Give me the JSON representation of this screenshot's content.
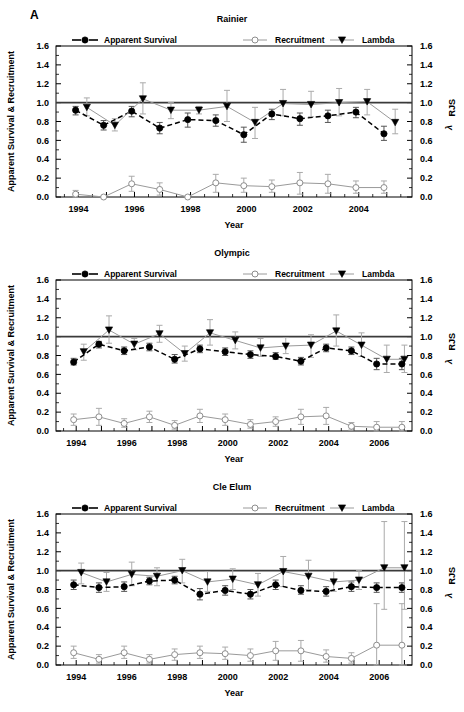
{
  "figure": {
    "panel_label": "A",
    "xlabel": "Year",
    "ylabel_left": "Apparent Survival & Recruitment",
    "ylabel_right_lambda": "λ",
    "ylabel_right_sub": "RJS",
    "ytick_labels": [
      "1.6",
      "1.4",
      "1.2",
      "1.0",
      "0.8",
      "0.6",
      "0.4",
      "0.2",
      "0.0"
    ],
    "ytick_values": [
      1.6,
      1.4,
      1.2,
      1.0,
      0.8,
      0.6,
      0.4,
      0.2,
      0.0
    ],
    "ylim": [
      0.0,
      1.6
    ],
    "reference_line_y": 1.0,
    "legend": [
      {
        "key": "apparent_survival",
        "label": "Apparent Survival",
        "marker": "filled-circle",
        "line": "dashed-black",
        "color": "#000000"
      },
      {
        "key": "recruitment",
        "label": "Recruitment",
        "marker": "open-circle",
        "line": "solid-gray",
        "color": "#9a9a9a"
      },
      {
        "key": "lambda",
        "label": "Lambda",
        "marker": "filled-down-triangle",
        "line": "solid-gray",
        "color": "#9a9a9a"
      }
    ]
  },
  "chart_data": [
    {
      "type": "line",
      "title": "Rainier",
      "xlabel": "Year",
      "ylabel": "Apparent Survival & Recruitment",
      "ylabel_right": "λ RJS",
      "ylim": [
        0.0,
        1.6
      ],
      "xlim": [
        1993.2,
        2005.9
      ],
      "xtick_labels": [
        "1994",
        "1996",
        "1998",
        "2000",
        "2002",
        "2004"
      ],
      "xtick_values": [
        1994,
        1996,
        1998,
        2000,
        2002,
        2004
      ],
      "grid": false,
      "legend_position": "top-inside",
      "reference_line_y": 1.0,
      "series": [
        {
          "name": "Apparent Survival",
          "x": [
            1993.9,
            1994.9,
            1995.9,
            1996.9,
            1997.9,
            1998.9,
            1999.9,
            2000.9,
            2001.9,
            2002.9,
            2003.9,
            2004.9
          ],
          "values": [
            0.92,
            0.76,
            0.91,
            0.73,
            0.82,
            0.81,
            0.66,
            0.88,
            0.83,
            0.86,
            0.9,
            0.67
          ],
          "err_low": [
            0.87,
            0.71,
            0.85,
            0.67,
            0.74,
            0.75,
            0.58,
            0.82,
            0.76,
            0.79,
            0.84,
            0.6
          ],
          "err_high": [
            0.96,
            0.81,
            0.96,
            0.79,
            0.89,
            0.87,
            0.74,
            0.93,
            0.89,
            0.92,
            0.95,
            0.75
          ]
        },
        {
          "name": "Recruitment",
          "x": [
            1993.9,
            1994.9,
            1995.9,
            1996.9,
            1997.9,
            1998.9,
            1999.9,
            2000.9,
            2001.9,
            2002.9,
            2003.9,
            2004.9
          ],
          "values": [
            0.03,
            0.0,
            0.14,
            0.08,
            0.0,
            0.15,
            0.12,
            0.11,
            0.15,
            0.14,
            0.1,
            0.1
          ],
          "err_low": [
            0.0,
            0.0,
            0.06,
            0.02,
            0.0,
            0.05,
            0.05,
            0.05,
            0.03,
            0.04,
            0.04,
            0.04
          ],
          "err_high": [
            0.07,
            0.0,
            0.22,
            0.15,
            0.0,
            0.24,
            0.2,
            0.18,
            0.26,
            0.24,
            0.17,
            0.17
          ]
        },
        {
          "name": "Lambda",
          "x": [
            1994.3,
            1995.3,
            1996.3,
            1997.3,
            1998.3,
            1999.3,
            2000.3,
            2001.3,
            2002.3,
            2003.3,
            2004.3,
            2005.3
          ],
          "values": [
            0.95,
            0.76,
            1.04,
            0.92,
            0.92,
            0.96,
            0.79,
            0.99,
            0.98,
            1.0,
            1.01,
            0.79
          ],
          "err_low": [
            0.86,
            0.7,
            0.88,
            0.83,
            0.88,
            0.8,
            0.62,
            0.86,
            0.85,
            0.86,
            0.87,
            0.67
          ],
          "err_high": [
            1.05,
            0.83,
            1.21,
            1.0,
            0.96,
            1.13,
            0.95,
            1.14,
            1.12,
            1.15,
            1.14,
            0.93
          ]
        }
      ]
    },
    {
      "type": "line",
      "title": "Olympic",
      "xlabel": "Year",
      "ylabel": "Apparent Survival & Recruitment",
      "ylabel_right": "λ RJS",
      "ylim": [
        0.0,
        1.6
      ],
      "xlim": [
        1993.2,
        2007.3
      ],
      "xtick_labels": [
        "1994",
        "1996",
        "1998",
        "2000",
        "2002",
        "2004",
        "2006"
      ],
      "xtick_values": [
        1994,
        1996,
        1998,
        2000,
        2002,
        2004,
        2006
      ],
      "grid": false,
      "legend_position": "top-inside",
      "reference_line_y": 1.0,
      "series": [
        {
          "name": "Apparent Survival",
          "x": [
            1993.9,
            1994.9,
            1995.9,
            1996.9,
            1997.9,
            1998.9,
            1999.9,
            2000.9,
            2001.9,
            2002.9,
            2003.9,
            2004.9,
            2005.9,
            2006.9
          ],
          "values": [
            0.73,
            0.92,
            0.85,
            0.89,
            0.76,
            0.87,
            0.84,
            0.81,
            0.79,
            0.74,
            0.88,
            0.85,
            0.71,
            0.71
          ],
          "err_low": [
            0.7,
            0.88,
            0.81,
            0.85,
            0.72,
            0.83,
            0.8,
            0.77,
            0.76,
            0.7,
            0.84,
            0.81,
            0.65,
            0.65
          ],
          "err_high": [
            0.77,
            0.95,
            0.89,
            0.93,
            0.81,
            0.91,
            0.88,
            0.85,
            0.83,
            0.78,
            0.92,
            0.89,
            0.77,
            0.77
          ]
        },
        {
          "name": "Recruitment",
          "x": [
            1993.9,
            1994.9,
            1995.9,
            1996.9,
            1997.9,
            1998.9,
            1999.9,
            2000.9,
            2001.9,
            2002.9,
            2003.9,
            2004.9,
            2005.9,
            2006.9
          ],
          "values": [
            0.12,
            0.15,
            0.08,
            0.15,
            0.06,
            0.16,
            0.12,
            0.07,
            0.1,
            0.15,
            0.16,
            0.05,
            0.04,
            0.04
          ],
          "err_low": [
            0.06,
            0.06,
            0.04,
            0.09,
            0.02,
            0.09,
            0.06,
            0.03,
            0.05,
            0.07,
            0.07,
            0.01,
            0.0,
            0.0
          ],
          "err_high": [
            0.18,
            0.24,
            0.13,
            0.21,
            0.11,
            0.23,
            0.18,
            0.12,
            0.15,
            0.23,
            0.25,
            0.09,
            0.1,
            0.1
          ]
        },
        {
          "name": "Lambda",
          "x": [
            1994.3,
            1995.3,
            1996.3,
            1997.3,
            1998.3,
            1999.3,
            2000.3,
            2001.3,
            2002.3,
            2003.3,
            2004.3,
            2005.3,
            2006.3,
            2007.0
          ],
          "values": [
            0.84,
            1.07,
            0.92,
            1.03,
            0.82,
            1.04,
            0.96,
            0.88,
            0.9,
            0.91,
            1.06,
            0.91,
            0.76,
            0.76
          ],
          "err_low": [
            0.75,
            0.93,
            0.86,
            0.94,
            0.74,
            0.91,
            0.87,
            0.79,
            0.82,
            0.78,
            0.9,
            0.79,
            0.62,
            0.62
          ],
          "err_high": [
            0.92,
            1.22,
            0.98,
            1.12,
            0.9,
            1.18,
            1.05,
            0.98,
            0.99,
            1.02,
            1.23,
            1.04,
            0.91,
            0.91
          ]
        }
      ]
    },
    {
      "type": "line",
      "title": "Cle Elum",
      "xlabel": "Year",
      "ylabel": "Apparent Survival & Recruitment",
      "ylabel_right": "λ RJS",
      "ylim": [
        0.0,
        1.6
      ],
      "xlim": [
        1993.2,
        2007.3
      ],
      "xtick_labels": [
        "1994",
        "1996",
        "1998",
        "2000",
        "2002",
        "2004",
        "2006"
      ],
      "xtick_values": [
        1994,
        1996,
        1998,
        2000,
        2002,
        2004,
        2006
      ],
      "grid": false,
      "legend_position": "top-inside",
      "reference_line_y": 1.0,
      "series": [
        {
          "name": "Apparent Survival",
          "x": [
            1993.9,
            1994.9,
            1995.9,
            1996.9,
            1997.9,
            1998.9,
            1999.9,
            2000.9,
            2001.9,
            2002.9,
            2003.9,
            2004.9,
            2005.9,
            2006.9
          ],
          "values": [
            0.85,
            0.82,
            0.83,
            0.89,
            0.9,
            0.75,
            0.79,
            0.75,
            0.85,
            0.79,
            0.78,
            0.83,
            0.82,
            0.82
          ],
          "err_low": [
            0.8,
            0.77,
            0.78,
            0.85,
            0.86,
            0.69,
            0.74,
            0.7,
            0.8,
            0.75,
            0.73,
            0.78,
            0.77,
            0.77
          ],
          "err_high": [
            0.9,
            0.87,
            0.88,
            0.93,
            0.94,
            0.81,
            0.84,
            0.8,
            0.9,
            0.84,
            0.83,
            0.88,
            0.87,
            0.87
          ]
        },
        {
          "name": "Recruitment",
          "x": [
            1993.9,
            1994.9,
            1995.9,
            1996.9,
            1997.9,
            1998.9,
            1999.9,
            2000.9,
            2001.9,
            2002.9,
            2003.9,
            2004.9,
            2005.9,
            2006.9
          ],
          "values": [
            0.13,
            0.06,
            0.13,
            0.06,
            0.11,
            0.13,
            0.12,
            0.1,
            0.15,
            0.15,
            0.09,
            0.07,
            0.21,
            0.21
          ],
          "err_low": [
            0.07,
            0.02,
            0.07,
            0.02,
            0.05,
            0.07,
            0.06,
            0.04,
            0.05,
            0.04,
            0.03,
            0.02,
            0.0,
            0.0
          ],
          "err_high": [
            0.2,
            0.11,
            0.2,
            0.11,
            0.17,
            0.2,
            0.19,
            0.17,
            0.25,
            0.26,
            0.16,
            0.13,
            0.65,
            0.65
          ]
        },
        {
          "name": "Lambda",
          "x": [
            1994.2,
            1995.2,
            1996.2,
            1997.2,
            1998.2,
            1999.2,
            2000.2,
            2001.2,
            2002.2,
            2003.2,
            2004.2,
            2005.2,
            2006.2,
            2007.0
          ],
          "values": [
            0.98,
            0.88,
            0.96,
            0.94,
            1.0,
            0.88,
            0.91,
            0.85,
            0.99,
            0.94,
            0.88,
            0.9,
            1.03,
            1.03
          ],
          "err_low": [
            0.86,
            0.78,
            0.84,
            0.84,
            0.87,
            0.78,
            0.8,
            0.73,
            0.83,
            0.8,
            0.78,
            0.8,
            0.59,
            0.59
          ],
          "err_high": [
            1.08,
            0.98,
            1.09,
            1.03,
            1.12,
            0.99,
            1.02,
            0.97,
            1.15,
            1.11,
            0.99,
            1.0,
            1.52,
            1.52
          ]
        }
      ]
    }
  ]
}
